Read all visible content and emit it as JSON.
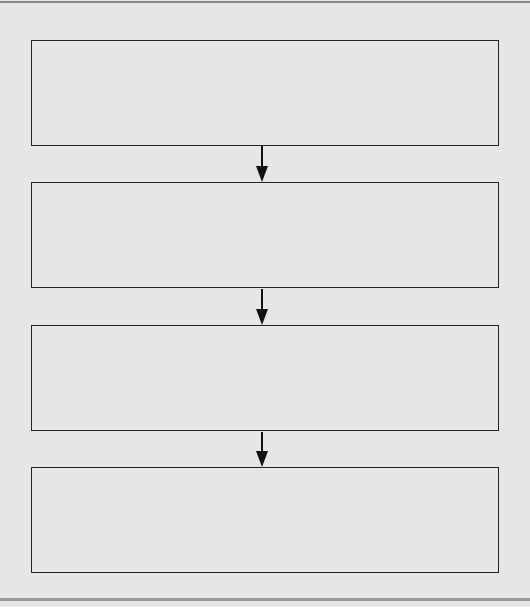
{
  "diagram": {
    "type": "flowchart",
    "direction": "top-to-bottom",
    "boxes": [
      {
        "id": "step1",
        "label": ""
      },
      {
        "id": "step2",
        "label": ""
      },
      {
        "id": "step3",
        "label": ""
      },
      {
        "id": "step4",
        "label": ""
      }
    ],
    "connectors": [
      {
        "from": "step1",
        "to": "step2"
      },
      {
        "from": "step2",
        "to": "step3"
      },
      {
        "from": "step3",
        "to": "step4"
      }
    ],
    "colors": {
      "background": "#e6e6e6",
      "stroke": "#222222"
    }
  }
}
